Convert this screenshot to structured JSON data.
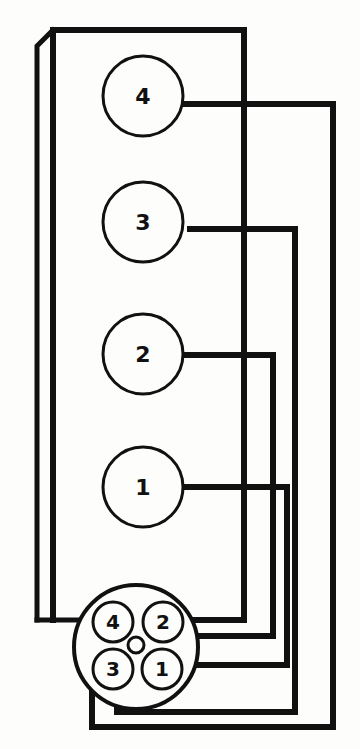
{
  "diagram": {
    "colors": {
      "line": "#111111",
      "background": "#fdfdfb"
    },
    "cylinders": [
      {
        "label": "4",
        "cx": 143,
        "cy": 96
      },
      {
        "label": "3",
        "cx": 143,
        "cy": 222
      },
      {
        "label": "2",
        "cx": 143,
        "cy": 354
      },
      {
        "label": "1",
        "cx": 143,
        "cy": 487
      }
    ],
    "distributor": {
      "terminals": [
        {
          "label": "4",
          "cx": 113,
          "cy": 622
        },
        {
          "label": "2",
          "cx": 163,
          "cy": 622
        },
        {
          "label": "3",
          "cx": 113,
          "cy": 669
        },
        {
          "label": "1",
          "cx": 162,
          "cy": 669
        }
      ]
    }
  }
}
